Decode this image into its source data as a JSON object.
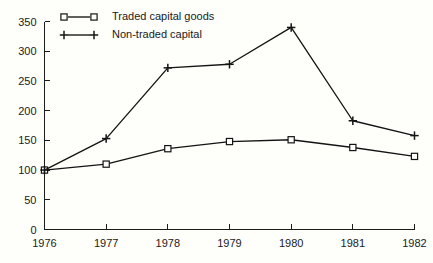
{
  "chart_data": {
    "type": "line",
    "title": "",
    "subtitle": "",
    "xlabel": "",
    "ylabel": "",
    "categories": [
      "1976",
      "1977",
      "1978",
      "1979",
      "1980",
      "1981",
      "1982"
    ],
    "x": [
      1976,
      1977,
      1978,
      1979,
      1980,
      1981,
      1982
    ],
    "series": [
      {
        "name": "Traded capital goods",
        "marker": "square",
        "values": [
          100,
          110,
          136,
          148,
          151,
          138,
          123
        ]
      },
      {
        "name": "Non-traded capital",
        "marker": "plus",
        "values": [
          100,
          153,
          272,
          278,
          340,
          183,
          158
        ]
      }
    ],
    "ylim": [
      0,
      350
    ],
    "yticks": [
      0,
      50,
      100,
      150,
      200,
      250,
      300,
      350
    ],
    "ytick_labels": [
      "0",
      "50",
      "100",
      "150",
      "200",
      "250",
      "300",
      "350"
    ],
    "xtick_labels": [
      "1976",
      "1977",
      "1978",
      "1979",
      "1980",
      "1981",
      "1982"
    ],
    "grid": false,
    "legend_position": "top-left-inside",
    "line_color": "#141414",
    "background_color": "#fefefb",
    "axis_color": "#1c1c1c"
  },
  "legend": {
    "entries": [
      {
        "label": "Traded capital goods",
        "marker": "square-marker"
      },
      {
        "label": "Non-traded capital",
        "marker": "plus-marker"
      }
    ]
  }
}
